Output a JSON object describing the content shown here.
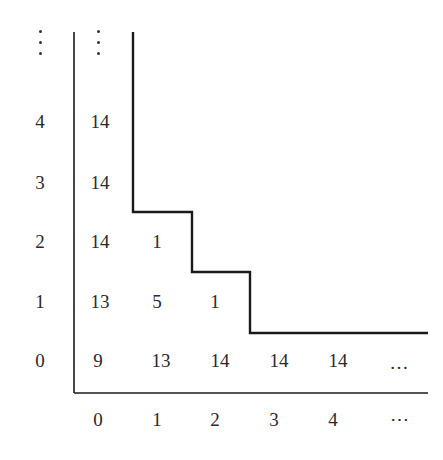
{
  "diagram": {
    "type": "staircase-grid",
    "row_labels": [
      "0",
      "1",
      "2",
      "3",
      "4",
      "⋮"
    ],
    "col_labels": [
      "0",
      "1",
      "2",
      "3",
      "4",
      "⋯"
    ],
    "cells": [
      {
        "row": 0,
        "col": 0,
        "value": "9"
      },
      {
        "row": 0,
        "col": 1,
        "value": "13"
      },
      {
        "row": 0,
        "col": 2,
        "value": "14"
      },
      {
        "row": 0,
        "col": 3,
        "value": "14"
      },
      {
        "row": 0,
        "col": 4,
        "value": "14"
      },
      {
        "row": 0,
        "col": 5,
        "value": "⋯"
      },
      {
        "row": 1,
        "col": 0,
        "value": "13"
      },
      {
        "row": 1,
        "col": 1,
        "value": "5"
      },
      {
        "row": 1,
        "col": 2,
        "value": "1"
      },
      {
        "row": 2,
        "col": 0,
        "value": "14"
      },
      {
        "row": 2,
        "col": 1,
        "value": "1"
      },
      {
        "row": 3,
        "col": 0,
        "value": "14"
      },
      {
        "row": 4,
        "col": 0,
        "value": "14"
      },
      {
        "row": 5,
        "col": 0,
        "value": "⋮"
      }
    ],
    "staircase_boundary": "separates cells (0,≥3),(1,≥3),(2,≥2),(≥3,≥1) region; corners at col 1 above row 2, col 2 above row 1, col 3 above row 0",
    "colors": {
      "line": "#1a1a1a",
      "text": "#2a2a2a",
      "background": "#ffffff"
    }
  },
  "labels": {
    "r0": "0",
    "r1": "1",
    "r2": "2",
    "r3": "3",
    "r4": "4",
    "c0": "0",
    "c1": "1",
    "c2": "2",
    "c3": "3",
    "c4": "4",
    "c_more": "⋯",
    "v00": "9",
    "v01": "13",
    "v02": "14",
    "v03": "14",
    "v04": "14",
    "v05": "…",
    "v10": "13",
    "v11": "5",
    "v12": "1",
    "v20": "14",
    "v21": "1",
    "v30": "14",
    "v40": "14"
  }
}
